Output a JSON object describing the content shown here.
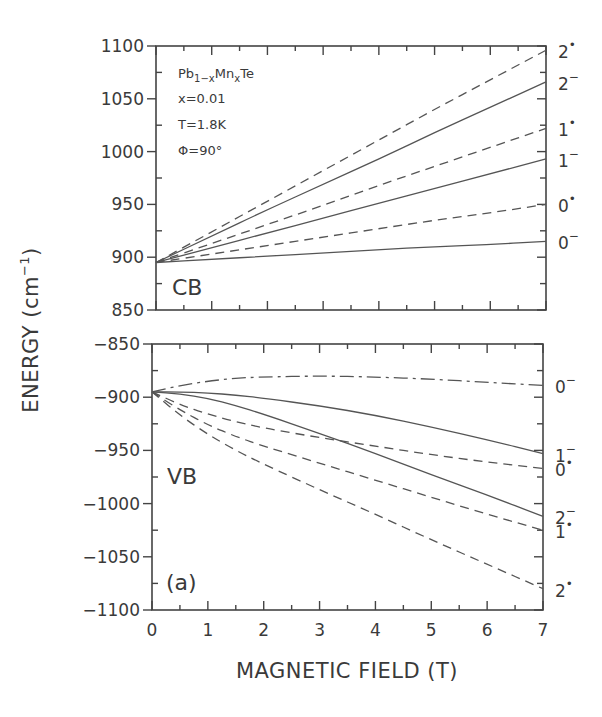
{
  "chart_data": [
    {
      "id": "cb",
      "type": "line",
      "title": "",
      "panel_label": "CB",
      "annotations": [
        "Pb1-xMnxTe",
        "x=0.01",
        "T=1.8K",
        "Φ=90°"
      ],
      "xlabel": "MAGNETIC FIELD (T)",
      "ylabel": "ENERGY (cm⁻¹)",
      "xlim": [
        0,
        7
      ],
      "ylim": [
        850,
        1100
      ],
      "x_ticks": [
        0,
        1,
        2,
        3,
        4,
        5,
        6,
        7
      ],
      "y_ticks": [
        850,
        900,
        950,
        1000,
        1050,
        1100
      ],
      "grid": false,
      "legend_position": "right-edge level labels",
      "x": [
        0,
        1,
        2,
        3,
        4,
        5,
        6,
        7
      ],
      "series": [
        {
          "name": "2+",
          "style": "dashed",
          "values": [
            895,
            924,
            953,
            982,
            1011,
            1040,
            1068,
            1096
          ]
        },
        {
          "name": "2-",
          "style": "solid",
          "values": [
            895,
            920,
            945,
            969,
            993,
            1018,
            1042,
            1066
          ]
        },
        {
          "name": "1+",
          "style": "dashed",
          "values": [
            895,
            913,
            931,
            949,
            968,
            986,
            1004,
            1022
          ]
        },
        {
          "name": "1-",
          "style": "solid",
          "values": [
            895,
            909,
            923,
            937,
            951,
            965,
            979,
            993
          ]
        },
        {
          "name": "0+",
          "style": "dashed",
          "values": [
            895,
            903,
            911,
            919,
            927,
            935,
            942,
            950
          ]
        },
        {
          "name": "0-",
          "style": "solid",
          "values": [
            895,
            898,
            901,
            904,
            907,
            910,
            912,
            915
          ]
        }
      ]
    },
    {
      "id": "vb",
      "type": "line",
      "title": "",
      "panel_label": "VB",
      "figure_tag": "(a)",
      "xlabel": "MAGNETIC FIELD (T)",
      "ylabel": "ENERGY (cm⁻¹)",
      "xlim": [
        0,
        7
      ],
      "ylim": [
        -1100,
        -850
      ],
      "x_ticks": [
        0,
        1,
        2,
        3,
        4,
        5,
        6,
        7
      ],
      "y_ticks": [
        -1100,
        -1050,
        -1000,
        -950,
        -900,
        -850
      ],
      "grid": false,
      "legend_position": "right-edge level labels",
      "x": [
        0,
        0.5,
        1,
        1.5,
        2,
        3,
        4,
        5,
        6,
        7
      ],
      "series": [
        {
          "name": "0-",
          "style": "dashdot",
          "values": [
            -895,
            -889,
            -885,
            -882,
            -881,
            -880,
            -881,
            -883,
            -886,
            -889
          ]
        },
        {
          "name": "1-",
          "style": "solid",
          "values": [
            -895,
            -895,
            -896,
            -898,
            -901,
            -908,
            -917,
            -928,
            -940,
            -953
          ]
        },
        {
          "name": "0+",
          "style": "dashed",
          "values": [
            -895,
            -907,
            -916,
            -923,
            -929,
            -938,
            -946,
            -954,
            -961,
            -967
          ]
        },
        {
          "name": "2-",
          "style": "solid",
          "values": [
            -895,
            -897,
            -901,
            -908,
            -916,
            -934,
            -953,
            -973,
            -992,
            -1012
          ]
        },
        {
          "name": "1+",
          "style": "dashed",
          "values": [
            -895,
            -912,
            -926,
            -937,
            -946,
            -962,
            -978,
            -994,
            -1010,
            -1025
          ]
        },
        {
          "name": "2+",
          "style": "dashed",
          "values": [
            -895,
            -917,
            -935,
            -950,
            -963,
            -987,
            -1010,
            -1034,
            -1057,
            -1080
          ]
        }
      ]
    }
  ],
  "labels": {
    "xlabel": "MAGNETIC FIELD (T)",
    "ylabel": "ENERGY (cm",
    "ylabel_sup": "−1",
    "ylabel_close": ")",
    "cb_tag": "CB",
    "vb_tag": "VB",
    "fig_tag": "(a)",
    "compound_base1": "Pb",
    "compound_sub1": "1−x",
    "compound_base2": "Mn",
    "compound_sub2": "x",
    "compound_base3": "Te",
    "x_value": "x=0.01",
    "temperature": "T=1.8K",
    "angle": "Φ=90°"
  },
  "colors": {
    "ink": "#3a3a3a",
    "line": "#555555",
    "background": "#ffffff"
  }
}
